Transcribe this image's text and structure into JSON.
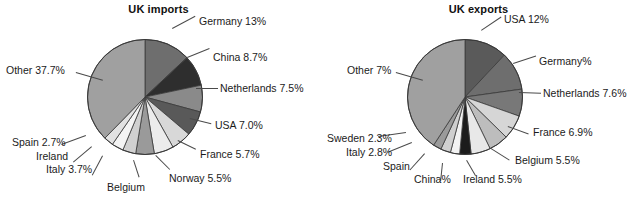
{
  "figure": {
    "background": "#ffffff",
    "text_color": "#1b1b1b",
    "leader_color": "#4a4a4a"
  },
  "chart_data": [
    {
      "type": "pie",
      "title": "UK imports",
      "panel": "left",
      "xlabel": "",
      "ylabel": "",
      "legend": "none",
      "grid": false,
      "start_angle_deg": 0,
      "direction": "clockwise",
      "units": "percent",
      "categories": [
        "Germany",
        "China",
        "Netherlands",
        "USA",
        "France",
        "Norway",
        "Belgium",
        "Italy",
        "Ireland",
        "Spain",
        "Other"
      ],
      "values": [
        13,
        8.7,
        7.5,
        7.0,
        5.7,
        5.5,
        5.2,
        3.7,
        3.3,
        2.7,
        37.7
      ],
      "labels": [
        "Germany 13%",
        "China 8.7%",
        "Netherlands 7.5%",
        "USA 7.0%",
        "France 5.7%",
        "Norway 5.5%",
        "Belgium",
        "Italy 3.7%",
        "Ireland",
        "Spain 2.7%",
        "Other 37.7%"
      ],
      "colors": [
        "#6e6e6e",
        "#2e2e2e",
        "#8a8a8a",
        "#595959",
        "#d8d8d8",
        "#ececec",
        "#9a9a9a",
        "#d0d0d0",
        "#f4f4f4",
        "#e2e2e2",
        "#a0a0a0"
      ]
    },
    {
      "type": "pie",
      "title": "UK exports",
      "panel": "right",
      "xlabel": "",
      "ylabel": "",
      "legend": "none",
      "grid": false,
      "start_angle_deg": 0,
      "direction": "clockwise",
      "units": "percent",
      "categories": [
        "USA",
        "Germany",
        "Netherlands",
        "France",
        "Belgium",
        "Ireland",
        "China",
        "Spain",
        "Italy",
        "Sweden",
        "Other"
      ],
      "values": [
        12,
        10.8,
        7.6,
        6.9,
        5.5,
        5.5,
        3.2,
        2.6,
        2.8,
        2.3,
        40.8
      ],
      "labels": [
        "USA 12%",
        "Germany%",
        "Netherlands 7.6%",
        "France 6.9%",
        "Belgium 5.5%",
        "Ireland 5.5%",
        "China%",
        "Spain",
        "Italy 2.8%",
        "Sweden 2.3%",
        "Other 7%"
      ],
      "colors": [
        "#5a5a5a",
        "#6e6e6e",
        "#787878",
        "#d6d6d6",
        "#bdbdbd",
        "#e8e8e8",
        "#1c1c1c",
        "#f2f2f2",
        "#cfcfcf",
        "#9a9a9a",
        "#a0a0a0"
      ]
    }
  ],
  "imports": {
    "title": "UK imports",
    "callouts": {
      "germany": "Germany 13%",
      "china": "China 8.7%",
      "netherlands": "Netherlands 7.5%",
      "usa": "USA 7.0%",
      "france": "France 5.7%",
      "norway": "Norway 5.5%",
      "belgium": "Belgium",
      "italy": "Italy 3.7%",
      "ireland": "Ireland",
      "spain": "Spain 2.7%",
      "other": "Other 37.7%"
    }
  },
  "exports": {
    "title": "UK exports",
    "callouts": {
      "usa": "USA 12%",
      "germany": "Germany%",
      "netherlands": "Netherlands 7.6%",
      "france": "France 6.9%",
      "belgium": "Belgium 5.5%",
      "ireland": "Ireland 5.5%",
      "china": "China%",
      "spain": "Spain",
      "italy": "Italy 2.8%",
      "sweden": "Sweden 2.3%",
      "other": "Other 7%"
    }
  }
}
